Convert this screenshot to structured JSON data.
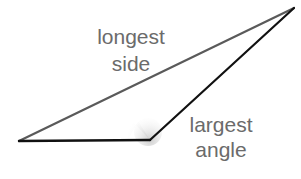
{
  "diagram": {
    "labels": {
      "side_line1": "longest",
      "side_line2": "side",
      "angle_line1": "largest",
      "angle_line2": "angle"
    },
    "vertices": {
      "left": [
        19,
        141
      ],
      "obtuse": [
        150,
        140
      ],
      "top": [
        294,
        8
      ]
    },
    "colors": {
      "longest_side": "#5a5a5a",
      "other_sides": "#111111",
      "label_text": "#6b6b6b",
      "angle_shade": "#cfcfcf"
    }
  }
}
